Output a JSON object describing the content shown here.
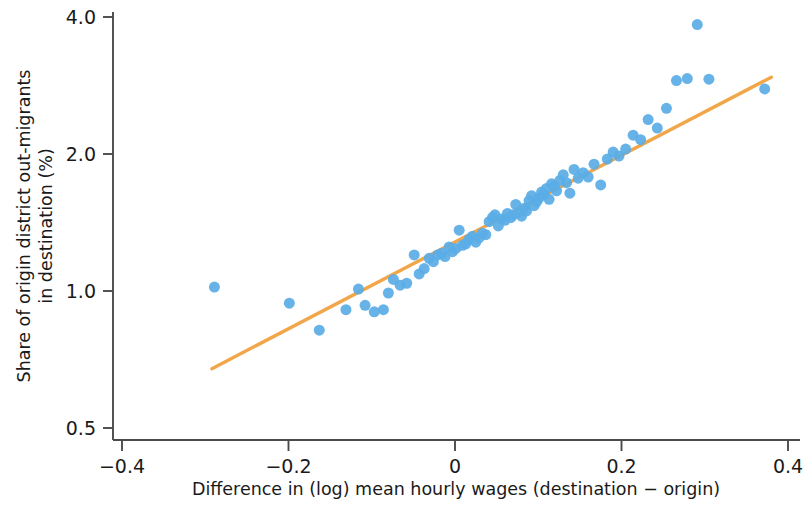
{
  "chart_data": {
    "type": "scatter",
    "title": "",
    "xlabel": "Difference in (log) mean hourly wages (destination − origin)",
    "ylabel_line1": "Share of origin district out-migrants",
    "ylabel_line2": "in destination (%)",
    "ylabel": "Share of origin district out-migrants in destination (%)",
    "xlim": [
      -0.44,
      0.41
    ],
    "ylim": [
      0.46,
      4.35
    ],
    "yscale": "log",
    "xscale": "linear",
    "grid": false,
    "legend": null,
    "xticks": [
      -0.4,
      -0.2,
      0,
      0.2,
      0.4
    ],
    "xtick_labels": [
      "−0.4",
      "−0.2",
      "0",
      "0.2",
      "0.4"
    ],
    "yticks": [
      0.5,
      1.0,
      2.0,
      4.0
    ],
    "ytick_labels": [
      "0.5",
      "1.0",
      "2.0",
      "4.0"
    ],
    "point_color": "#5AACE6",
    "line_color": "#F0A martin",
    "marker_size": 11,
    "series": [
      {
        "name": "districts",
        "type": "scatter",
        "x": [
          -0.289,
          -0.199,
          -0.163,
          -0.131,
          -0.116,
          -0.108,
          -0.097,
          -0.086,
          -0.08,
          -0.074,
          -0.066,
          -0.058,
          -0.049,
          -0.043,
          -0.037,
          -0.031,
          -0.026,
          -0.021,
          -0.016,
          -0.012,
          -0.007,
          -0.003,
          0.001,
          0.005,
          0.009,
          0.013,
          0.017,
          0.021,
          0.025,
          0.029,
          0.033,
          0.037,
          0.041,
          0.045,
          0.048,
          0.052,
          0.056,
          0.06,
          0.063,
          0.067,
          0.07,
          0.073,
          0.077,
          0.08,
          0.083,
          0.086,
          0.089,
          0.092,
          0.095,
          0.098,
          0.101,
          0.104,
          0.107,
          0.11,
          0.113,
          0.116,
          0.119,
          0.122,
          0.126,
          0.13,
          0.134,
          0.138,
          0.143,
          0.148,
          0.154,
          0.16,
          0.167,
          0.175,
          0.183,
          0.19,
          0.197,
          0.205,
          0.214,
          0.223,
          0.232,
          0.243,
          0.254,
          0.266,
          0.279,
          0.291,
          0.305,
          0.372
        ],
        "y": [
          1.02,
          0.94,
          0.82,
          0.91,
          1.01,
          0.93,
          0.9,
          0.91,
          0.99,
          1.06,
          1.03,
          1.04,
          1.2,
          1.09,
          1.12,
          1.18,
          1.16,
          1.2,
          1.21,
          1.19,
          1.25,
          1.22,
          1.24,
          1.36,
          1.26,
          1.27,
          1.3,
          1.32,
          1.28,
          1.31,
          1.34,
          1.33,
          1.42,
          1.45,
          1.47,
          1.39,
          1.44,
          1.43,
          1.48,
          1.45,
          1.47,
          1.55,
          1.49,
          1.46,
          1.52,
          1.5,
          1.58,
          1.62,
          1.54,
          1.57,
          1.6,
          1.65,
          1.63,
          1.68,
          1.59,
          1.72,
          1.7,
          1.66,
          1.75,
          1.8,
          1.73,
          1.64,
          1.85,
          1.77,
          1.82,
          1.78,
          1.9,
          1.71,
          1.95,
          2.02,
          1.98,
          2.05,
          2.2,
          2.15,
          2.38,
          2.28,
          2.52,
          2.9,
          2.93,
          3.85,
          2.92,
          2.78
        ],
        "color": "#5AACE6"
      },
      {
        "name": "fitted-trend-line",
        "type": "line",
        "x": [
          -0.292,
          0.38
        ],
        "y": [
          0.675,
          2.95
        ],
        "color": "#F2A64A"
      }
    ]
  },
  "axes": {
    "x_axis_name": "x-axis",
    "y_axis_name": "y-axis"
  }
}
